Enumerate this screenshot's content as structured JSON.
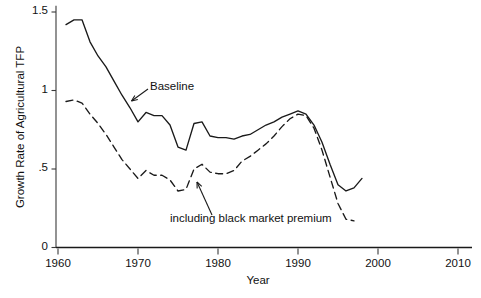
{
  "chart_data": {
    "type": "line",
    "title": "",
    "xlabel": "Year",
    "ylabel": "Growth Rate of Agricultural TFP",
    "xlim": [
      1960,
      2011
    ],
    "ylim": [
      0,
      1.55
    ],
    "xticks": [
      1960,
      1970,
      1980,
      1990,
      2000,
      2010
    ],
    "xticklabels": [
      "1960",
      "1970",
      "1980",
      "1990",
      "2000",
      "2010"
    ],
    "yticks": [
      0,
      0.5,
      1,
      1.5
    ],
    "yticklabels": [
      "0",
      ".5",
      "1",
      "1.5"
    ],
    "grid": false,
    "legend_position": "inline-annotations",
    "zero_line": true,
    "series": [
      {
        "name": "Baseline",
        "style": "solid",
        "color": "#1a1a1a",
        "x": [
          1961,
          1962,
          1963,
          1964,
          1965,
          1966,
          1967,
          1968,
          1969,
          1970,
          1971,
          1972,
          1973,
          1974,
          1975,
          1976,
          1977,
          1978,
          1979,
          1980,
          1981,
          1982,
          1983,
          1984,
          1985,
          1986,
          1987,
          1988,
          1989,
          1990,
          1991,
          1992,
          1993,
          1994,
          1995,
          1996,
          1997,
          1998
        ],
        "values": [
          1.42,
          1.45,
          1.45,
          1.31,
          1.22,
          1.15,
          1.06,
          0.97,
          0.89,
          0.8,
          0.86,
          0.84,
          0.84,
          0.78,
          0.64,
          0.62,
          0.79,
          0.8,
          0.71,
          0.7,
          0.7,
          0.69,
          0.71,
          0.72,
          0.75,
          0.78,
          0.8,
          0.83,
          0.85,
          0.87,
          0.85,
          0.78,
          0.67,
          0.53,
          0.4,
          0.36,
          0.38,
          0.44
        ]
      },
      {
        "name": "including black market premium",
        "style": "dashed",
        "color": "#1a1a1a",
        "x": [
          1961,
          1962,
          1963,
          1964,
          1965,
          1966,
          1967,
          1968,
          1969,
          1970,
          1971,
          1972,
          1973,
          1974,
          1975,
          1976,
          1977,
          1978,
          1979,
          1980,
          1981,
          1982,
          1983,
          1984,
          1985,
          1986,
          1987,
          1988,
          1989,
          1990,
          1991,
          1992,
          1993,
          1994,
          1995,
          1996,
          1997
        ],
        "values": [
          0.93,
          0.94,
          0.92,
          0.85,
          0.79,
          0.72,
          0.64,
          0.56,
          0.5,
          0.44,
          0.49,
          0.46,
          0.46,
          0.43,
          0.36,
          0.37,
          0.5,
          0.53,
          0.48,
          0.47,
          0.47,
          0.49,
          0.55,
          0.58,
          0.62,
          0.66,
          0.71,
          0.77,
          0.82,
          0.85,
          0.84,
          0.76,
          0.62,
          0.45,
          0.28,
          0.18,
          0.17
        ]
      }
    ],
    "annotations": [
      {
        "label": "Baseline",
        "points_to_series": "Baseline",
        "at_year": 1969
      },
      {
        "label": "including black market premium",
        "points_to_series": "including black market premium",
        "at_year": 1978
      }
    ]
  },
  "axis": {
    "x_title": "Year",
    "y_title": "Growth Rate of Agricultural TFP"
  }
}
